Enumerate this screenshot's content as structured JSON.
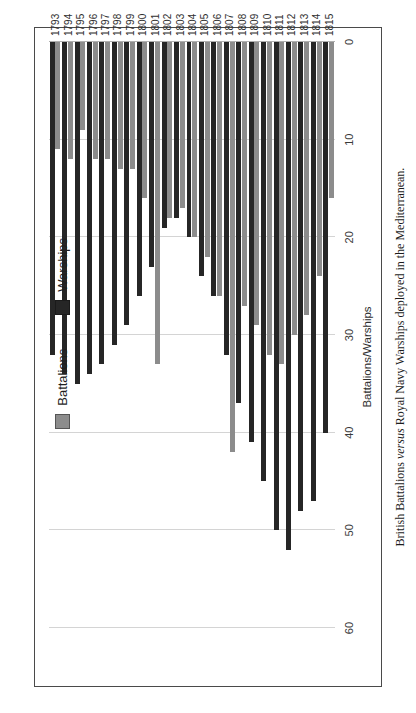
{
  "figure": {
    "caption_prefix": "British Battalions ",
    "caption_emphasis": "versus",
    "caption_suffix": " Royal Navy Warships deployed in the Mediterranean."
  },
  "legend": {
    "position": "top-left",
    "items": [
      {
        "label": "Battalions",
        "color": "#8c8c8c",
        "swatch": "battalions-swatch"
      },
      {
        "label": "Warships",
        "color": "#262626",
        "swatch": "warships-swatch"
      }
    ]
  },
  "axis": {
    "value_title": "Battalions/Warships",
    "ticks": [
      "0",
      "10",
      "20",
      "30",
      "40",
      "50",
      "60"
    ]
  },
  "chart_data": {
    "type": "bar",
    "orientation": "vertical-grouped",
    "title": "",
    "xlabel": "",
    "ylabel": "Battalions/Warships",
    "ylim": [
      0,
      60
    ],
    "ytick_step": 10,
    "grid": true,
    "legend_position": "top-left",
    "categories": [
      "1793",
      "1794",
      "1795",
      "1796",
      "1797",
      "1798",
      "1799",
      "1800",
      "1801",
      "1802",
      "1803",
      "1804",
      "1805",
      "1806",
      "1807",
      "1808",
      "1809",
      "1810",
      "1811",
      "1812",
      "1813",
      "1814",
      "1815"
    ],
    "series": [
      {
        "name": "Battalions",
        "color": "#8c8c8c",
        "values": [
          11,
          12,
          9,
          12,
          12,
          13,
          13,
          16,
          33,
          18,
          17,
          20,
          22,
          26,
          42,
          27,
          29,
          32,
          33,
          30,
          28,
          24,
          16
        ]
      },
      {
        "name": "Warships",
        "color": "#262626",
        "values": [
          32,
          34,
          35,
          34,
          33,
          31,
          29,
          26,
          23,
          19,
          18,
          20,
          24,
          26,
          32,
          37,
          41,
          45,
          50,
          52,
          48,
          47,
          40
        ]
      }
    ]
  }
}
